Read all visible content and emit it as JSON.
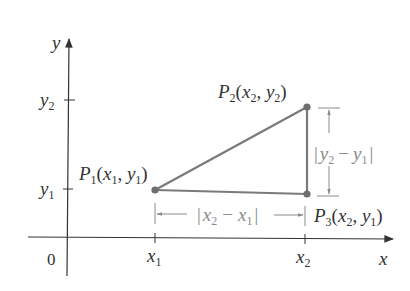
{
  "diagram": {
    "type": "coordinate-geometry",
    "colors": {
      "axes": "#333333",
      "triangle": "#7a7a7a",
      "points": "#6e6e6e",
      "dimension_lines": "#8a8a8a",
      "text": "#333333"
    },
    "axes": {
      "x_label": "x",
      "y_label": "y",
      "origin_label": "0",
      "x_ticks": [
        {
          "var": "x",
          "sub": "1"
        },
        {
          "var": "x",
          "sub": "2"
        }
      ],
      "y_ticks": [
        {
          "var": "y",
          "sub": "2"
        },
        {
          "var": "y",
          "sub": "1"
        }
      ]
    },
    "points": [
      {
        "name": "P",
        "sub": "1",
        "coords": [
          {
            "v": "x",
            "s": "1"
          },
          {
            "v": "y",
            "s": "1"
          }
        ]
      },
      {
        "name": "P",
        "sub": "2",
        "coords": [
          {
            "v": "x",
            "s": "2"
          },
          {
            "v": "y",
            "s": "2"
          }
        ]
      },
      {
        "name": "P",
        "sub": "3",
        "coords": [
          {
            "v": "x",
            "s": "2"
          },
          {
            "v": "y",
            "s": "1"
          }
        ]
      }
    ],
    "dimensions": {
      "horizontal": {
        "a": {
          "v": "x",
          "s": "2"
        },
        "b": {
          "v": "x",
          "s": "1"
        },
        "minus": "−"
      },
      "vertical": {
        "a": {
          "v": "y",
          "s": "2"
        },
        "b": {
          "v": "y",
          "s": "1"
        },
        "minus": "−"
      }
    },
    "punct": {
      "open": "(",
      "close": ")",
      "comma": ", ",
      "bar": "|"
    }
  }
}
